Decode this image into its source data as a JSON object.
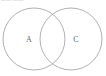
{
  "figure": {
    "kind": "venn-diagram",
    "width": 106,
    "height": 76,
    "background_color": "#ffffff",
    "header_fragment_text": "—— ——",
    "stroke_color": "#9d9aa6",
    "label_color": "#5f5f66"
  },
  "chart_data": {
    "type": "venn",
    "title": "",
    "sets": [
      {
        "label": "A",
        "name": "set-a",
        "cx": 34,
        "cy": 39,
        "r": 31,
        "label_x": 29,
        "label_y": 39,
        "stroke": "#9d9aa6",
        "fill": "none"
      },
      {
        "label": "C",
        "name": "set-c",
        "cx": 71,
        "cy": 39,
        "r": 31,
        "label_x": 76,
        "label_y": 39,
        "stroke": "#9d9aa6",
        "fill": "none"
      }
    ],
    "intersection": {
      "label": "",
      "upper_point": [
        53,
        14
      ],
      "lower_point": [
        53,
        63
      ],
      "shaded": false
    },
    "legend": [],
    "annotations": [],
    "grid": false,
    "xlabel": "",
    "ylabel": ""
  }
}
